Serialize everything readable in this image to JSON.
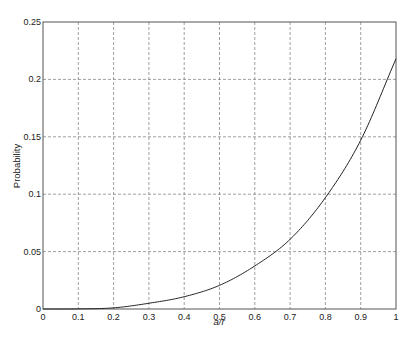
{
  "chart_data": {
    "type": "line",
    "title": "",
    "xlabel": "a/r",
    "ylabel": "Probability",
    "xlim": [
      0,
      1
    ],
    "ylim": [
      0,
      0.25
    ],
    "grid": true,
    "legend": null,
    "x_ticks": [
      "0",
      "0.1",
      "0.2",
      "0.3",
      "0.4",
      "0.5",
      "0.6",
      "0.7",
      "0.8",
      "0.9",
      "1"
    ],
    "y_ticks": [
      "0",
      "0.05",
      "0.1",
      "0.15",
      "0.2",
      "0.25"
    ],
    "series": [
      {
        "name": "Probability",
        "color": "#222222",
        "x": [
          0,
          0.1,
          0.2,
          0.3,
          0.4,
          0.5,
          0.6,
          0.7,
          0.8,
          0.9,
          1.0
        ],
        "values": [
          0,
          0.0001,
          0.001,
          0.005,
          0.0107,
          0.0206,
          0.0375,
          0.0607,
          0.097,
          0.147,
          0.218
        ]
      }
    ]
  }
}
